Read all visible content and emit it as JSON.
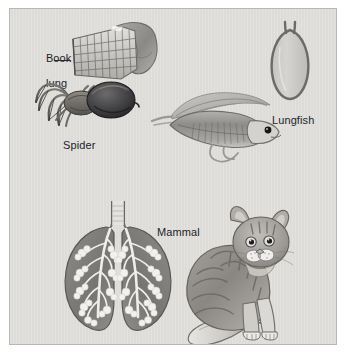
{
  "figure": {
    "background_color": "#dedcd8",
    "panel_border_color": "#b9b7b3",
    "ink_color": "#22242a",
    "type": "grayscale biology illustration"
  },
  "labels": {
    "book_lung_line1": "Book",
    "book_lung_line2": "lung",
    "spider": "Spider",
    "lungfish": "Lungfish",
    "mammal": "Mammal"
  },
  "specimens": [
    {
      "id": "book-lung",
      "label": "Book lung",
      "description": "cutaway of a spider book lung showing stacked lamellae",
      "icon": "book-lung-icon"
    },
    {
      "id": "spider",
      "label": "Spider",
      "description": "side view of a spider with eight legs and bulbous abdomen",
      "icon": "spider-icon"
    },
    {
      "id": "lungfish-lung",
      "label": "Lungfish",
      "description": "simple sac-like lung with a single duct",
      "icon": "lungfish-lung-icon"
    },
    {
      "id": "lungfish",
      "label": "Lungfish",
      "description": "lungfish with elongated body, dorsal fin and filamentous pelvic fins",
      "icon": "lungfish-icon"
    },
    {
      "id": "mammal-lungs",
      "label": "Mammal",
      "description": "paired mammalian lungs with trachea, bronchi and alveolar clusters",
      "icon": "mammal-lungs-icon"
    },
    {
      "id": "cat",
      "label": "Mammal",
      "description": "seated tabby cat in three-quarter view",
      "icon": "cat-icon"
    }
  ],
  "colors": {
    "panel": "#dedcd8",
    "panel_border": "#b9b7b3",
    "text": "#22242a",
    "organ_dark": "#7b7a78",
    "organ_mid": "#a3a19d",
    "organ_light": "#cfcdc9",
    "outline": "#4a4a4c"
  }
}
